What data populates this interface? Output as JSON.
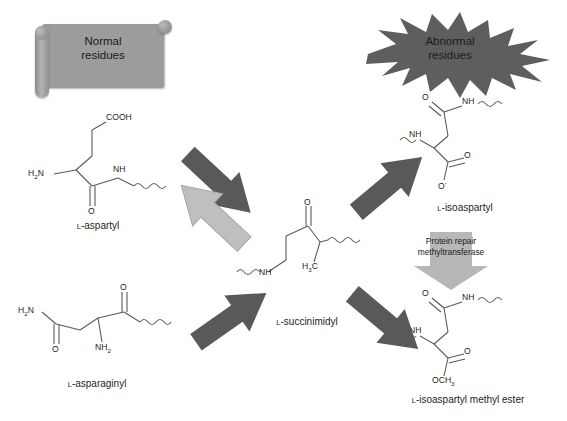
{
  "figure": {
    "title_present": false,
    "background": "#ffffff",
    "colors": {
      "dark_arrow": "#595959",
      "light_arrow": "#bfbfbf",
      "scroll_fill": "#9c9c9c",
      "burst_fill": "#5e5e5e",
      "enzyme_arrow": "#b7b7b7",
      "bond_line": "#5a5a5a",
      "text": "#231f20"
    }
  },
  "callouts": {
    "normal": {
      "line1": "Normal",
      "line2": "residues"
    },
    "abnormal": {
      "line1": "Abnormal",
      "line2": "residues"
    }
  },
  "enzyme": {
    "line1": "Protein repair",
    "line2": "methyltransferase",
    "arrow_direction": "down"
  },
  "structures": {
    "aspartyl": {
      "label_prefix": "L",
      "label": "-aspartyl",
      "full_label": "L-aspartyl",
      "atoms": [
        {
          "name": "carboxyl-group",
          "text": "COOH"
        },
        {
          "name": "amino-group",
          "text": "H2N"
        },
        {
          "name": "amide-nitrogen",
          "text": "NH"
        },
        {
          "name": "carbonyl-oxygen",
          "text": "O"
        }
      ]
    },
    "asparaginyl": {
      "label_prefix": "L",
      "label": "-asparaginyl",
      "full_label": "L-asparaginyl",
      "atoms": [
        {
          "name": "side-chain-amide-nitrogen",
          "text": "H2N"
        },
        {
          "name": "side-chain-carbonyl-oxygen",
          "text": "O"
        },
        {
          "name": "alpha-amino-group",
          "text": "NH2"
        },
        {
          "name": "backbone-carbonyl-oxygen",
          "text": "O"
        }
      ]
    },
    "succinimidyl": {
      "label_prefix": "L",
      "label": "-succinimidyl",
      "full_label": "L-succinimidyl",
      "atoms": [
        {
          "name": "ring-carbonyl-oxygen",
          "text": "O"
        },
        {
          "name": "ring-nitrogen",
          "text": "NH"
        },
        {
          "name": "methyl-carbon",
          "text": "H3C"
        }
      ]
    },
    "isoaspartyl": {
      "label_prefix": "L",
      "label": "-isoaspartyl",
      "full_label": "L-isoaspartyl",
      "atoms": [
        {
          "name": "backbone-carbonyl-oxygen",
          "text": "O"
        },
        {
          "name": "amide-nitrogen",
          "text": "NH"
        },
        {
          "name": "alpha-amino-nitrogen",
          "text": "NH"
        },
        {
          "name": "carboxylate-oxygen",
          "text": "O"
        },
        {
          "name": "carboxylate-anion-oxygen",
          "text": "O-"
        }
      ]
    },
    "isoaspartyl_methyl_ester": {
      "label_prefix": "L",
      "label": "-isoaspartyl methyl ester",
      "full_label": "L-isoaspartyl methyl ester",
      "atoms": [
        {
          "name": "backbone-carbonyl-oxygen",
          "text": "O"
        },
        {
          "name": "amide-nitrogen",
          "text": "NH"
        },
        {
          "name": "alpha-amino-nitrogen",
          "text": "NH"
        },
        {
          "name": "ester-carbonyl-oxygen",
          "text": "O"
        },
        {
          "name": "methoxy-group",
          "text": "OCH3"
        }
      ]
    }
  },
  "arrows": [
    {
      "name": "aspartyl-to-succinimidyl",
      "direction": "down-right",
      "shade": "dark"
    },
    {
      "name": "succinimidyl-to-aspartyl",
      "direction": "up-left",
      "shade": "light"
    },
    {
      "name": "asparaginyl-to-succinimidyl",
      "direction": "up-right",
      "shade": "dark"
    },
    {
      "name": "succinimidyl-to-isoaspartyl",
      "direction": "up-right",
      "shade": "dark"
    },
    {
      "name": "succinimidyl-to-methyl-ester",
      "direction": "down-right",
      "shade": "dark"
    }
  ]
}
